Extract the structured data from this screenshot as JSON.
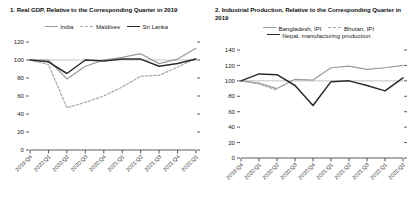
{
  "panels": [
    {
      "title": "1. Real GDP, Relative to the Corresponding Quarter in 2019",
      "legend": [
        {
          "label": "India",
          "style": "solid-gray"
        },
        {
          "label": "Maldives",
          "style": "dash-gray"
        },
        {
          "label": "Sri Lanka",
          "style": "solid-dark"
        }
      ]
    },
    {
      "title": "2. Industrial Production, Relative to the Corresponding Quarter in 2019",
      "legend": [
        {
          "label": "Bangladesh, IPI",
          "style": "solid-gray"
        },
        {
          "label": "Bhutan, IPI",
          "style": "dash-gray"
        },
        {
          "label": "Nepal, manufacturing production",
          "style": "solid-dark"
        }
      ]
    }
  ],
  "chart_data": [
    {
      "type": "line",
      "title": "1. Real GDP, Relative to the Corresponding Quarter in 2019",
      "xlabel": "",
      "ylabel": "",
      "ylim": [
        0,
        120
      ],
      "yticks": [
        0,
        20,
        40,
        60,
        80,
        100,
        120
      ],
      "grid": false,
      "reference_line": 100,
      "legend_position": "top-center",
      "categories": [
        "2019:Q4",
        "2020:Q1",
        "2020:Q2",
        "2020:Q3",
        "2020:Q4",
        "2021:Q1",
        "2021:Q2",
        "2021:Q3",
        "2021:Q4",
        "2022:Q1"
      ],
      "series": [
        {
          "name": "India",
          "style": "solid-gray",
          "color": "#9a9a9a",
          "values": [
            100,
            100,
            79,
            93,
            100,
            103,
            107,
            96,
            101,
            113
          ]
        },
        {
          "name": "Maldives",
          "style": "dash-gray",
          "color": "#a8a8a8",
          "values": [
            100,
            95,
            47,
            53,
            60,
            70,
            82,
            83,
            92,
            102
          ]
        },
        {
          "name": "Sri Lanka",
          "style": "solid-dark",
          "color": "#2b2b2b",
          "values": [
            100,
            98,
            85,
            100,
            99,
            101,
            101,
            93,
            96,
            101
          ]
        }
      ]
    },
    {
      "type": "line",
      "title": "2. Industrial Production, Relative to the Corresponding Quarter in 2019",
      "xlabel": "",
      "ylabel": "",
      "ylim": [
        0,
        140
      ],
      "yticks": [
        0,
        20,
        40,
        60,
        80,
        100,
        120,
        140
      ],
      "grid": false,
      "reference_line": 100,
      "legend_position": "top-center",
      "categories": [
        "2019:Q4",
        "2020:Q1",
        "2020:Q2",
        "2020:Q3",
        "2020:Q4",
        "2021:Q1",
        "2021:Q2",
        "2021:Q3",
        "2022:Q1",
        "2022:Q2"
      ],
      "series": [
        {
          "name": "Bangladesh, IPI",
          "style": "solid-gray",
          "color": "#9a9a9a",
          "values": [
            100,
            97,
            90,
            102,
            101,
            117,
            119,
            115,
            117,
            120
          ]
        },
        {
          "name": "Bhutan, IPI",
          "style": "dash-gray",
          "color": "#a8a8a8",
          "values": [
            100,
            96,
            88,
            null,
            null,
            null,
            null,
            null,
            null,
            null
          ]
        },
        {
          "name": "Nepal, manufacturing production",
          "style": "solid-dark",
          "color": "#2b2b2b",
          "values": [
            100,
            109,
            108,
            94,
            68,
            99,
            100,
            94,
            87,
            104
          ]
        }
      ]
    }
  ]
}
